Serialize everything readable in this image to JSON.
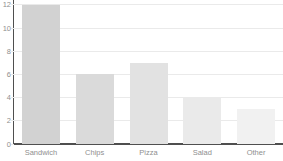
{
  "chart_data": {
    "type": "bar",
    "title": "",
    "xlabel": "",
    "ylabel": "",
    "categories": [
      "Sandwich",
      "Chips",
      "Pizza",
      "Salad",
      "Other"
    ],
    "values": [
      12,
      6,
      7,
      4,
      3
    ],
    "ylim": [
      0,
      12
    ],
    "yticks": [
      0,
      2,
      4,
      6,
      8,
      10,
      12
    ],
    "grid": true,
    "legend": false,
    "bar_colors": [
      "#d2d2d2",
      "#dadada",
      "#e2e2e2",
      "#eaeaea",
      "#f1f1f1"
    ],
    "gridline_color": "#eaeaea",
    "axis_color": "#4f4f4f",
    "tick_label_color": "#8f8f8f"
  }
}
